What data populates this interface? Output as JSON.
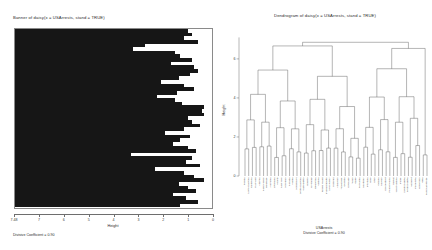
{
  "banner": {
    "title": "Banner of  daisy(x = USArrests, stand = TRUE)",
    "xlabel": "Height",
    "caption": "Divisive Coefficient = 0.90",
    "xticks": [
      "7.48",
      "7",
      "6",
      "5",
      "4",
      "3",
      "2",
      "1",
      "0"
    ]
  },
  "dendrogram": {
    "title": "Dendrogram of  daisy(x = USArrests, stand = TRUE)",
    "ylabel": "Height",
    "caption_line1": "USArrests",
    "caption_line2": "Divisive Coefficient = 0.90",
    "yticks": [
      "0",
      "2",
      "4",
      "6"
    ]
  },
  "chart_data": {
    "type": "bar",
    "title": "Banner of  daisy(x = USArrests, stand = TRUE)",
    "xlabel": "Height",
    "ylabel": "",
    "xlim": [
      7.48,
      0
    ],
    "grid": false,
    "legend": null,
    "note": "DIANA divisive banner: each of 49 rows is a split, bar length = split height measured from left (height 7.48) toward 0 at right.",
    "categories": [
      "s1",
      "s2",
      "s3",
      "s4",
      "s5",
      "s6",
      "s7",
      "s8",
      "s9",
      "s10",
      "s11",
      "s12",
      "s13",
      "s14",
      "s15",
      "s16",
      "s17",
      "s18",
      "s19",
      "s20",
      "s21",
      "s22",
      "s23",
      "s24",
      "s25",
      "s26",
      "s27",
      "s28",
      "s29",
      "s30",
      "s31",
      "s32",
      "s33",
      "s34",
      "s35",
      "s36",
      "s37",
      "s38",
      "s39",
      "s40",
      "s41",
      "s42",
      "s43",
      "s44",
      "s45",
      "s46",
      "s47",
      "s48",
      "s49"
    ],
    "values": [
      0.88,
      0.9,
      0.86,
      0.93,
      0.66,
      0.6,
      0.81,
      0.84,
      0.9,
      0.79,
      0.91,
      0.93,
      0.89,
      0.83,
      0.74,
      0.86,
      0.91,
      0.82,
      0.72,
      0.81,
      0.85,
      0.96,
      0.95,
      0.96,
      0.88,
      0.9,
      0.94,
      0.86,
      0.76,
      0.89,
      0.84,
      0.8,
      0.88,
      0.92,
      0.59,
      0.9,
      0.87,
      0.94,
      0.71,
      0.86,
      0.91,
      0.96,
      0.83,
      0.88,
      0.92,
      0.8,
      0.87,
      0.93,
      0.84
    ],
    "dendrogram": {
      "type": "dendrogram",
      "title": "Dendrogram of  daisy(x = USArrests, stand = TRUE)",
      "ylabel": "Height",
      "ylim": [
        0,
        7.48
      ],
      "yticks": [
        0,
        2,
        4,
        6
      ],
      "root_height": 6.85,
      "leaves": [
        "Florida",
        "North Carolina",
        "California",
        "Maryland",
        "Arizona",
        "New Mexico",
        "Delaware",
        "Alabama",
        "Louisiana",
        "Illinois",
        "New York",
        "Michigan",
        "Nevada",
        "Alaska",
        "Mississippi",
        "South Carolina",
        "Washington",
        "Oregon",
        "Wyoming",
        "Oklahoma",
        "Virginia",
        "Rhode Island",
        "Massachusetts",
        "New Jersey",
        "Missouri",
        "Arkansas",
        "Tennessee",
        "Georgia",
        "Colorado",
        "Texas",
        "Idaho",
        "Nebraska",
        "Kentucky",
        "Montana",
        "Ohio",
        "Utah",
        "Indiana",
        "Kansas",
        "Connecticut",
        "Pennsylvania",
        "Hawaii",
        "West Virginia",
        "Maine",
        "South Dakota",
        "North Dakota",
        "Vermont",
        "Minnesota",
        "Wisconsin",
        "Iowa",
        "New Hampshire"
      ]
    }
  }
}
